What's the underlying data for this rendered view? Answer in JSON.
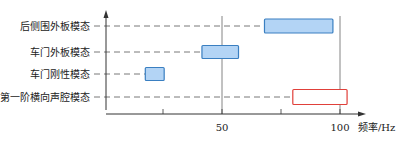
{
  "chart_data": {
    "type": "bar",
    "subtype": "floating-range",
    "title": "",
    "xlabel": "频率/Hz",
    "ylabel": "",
    "xlim": [
      0,
      105
    ],
    "grid": false,
    "legend": "none",
    "x_ticks": [
      25,
      50,
      75,
      100
    ],
    "x_tick_labels": [
      {
        "value": 50,
        "label": "50"
      },
      {
        "value": 100,
        "label": "100"
      }
    ],
    "reference_lines": [
      50,
      100
    ],
    "categories": [
      "后侧围外板模态",
      "车门外板模态",
      "车门刚性模态",
      "第一阶横向声腔模态"
    ],
    "series": [
      {
        "name": "后侧围外板模态",
        "start": 68,
        "end": 97,
        "style": "filled",
        "color": "#b3d4f5",
        "stroke": "#3a7fc1"
      },
      {
        "name": "车门外板模态",
        "start": 41.5,
        "end": 57,
        "style": "filled",
        "color": "#b3d4f5",
        "stroke": "#3a7fc1"
      },
      {
        "name": "车门刚性模态",
        "start": 17.5,
        "end": 25.5,
        "style": "filled",
        "color": "#b3d4f5",
        "stroke": "#3a7fc1"
      },
      {
        "name": "第一阶横向声腔模态",
        "start": 80,
        "end": 103,
        "style": "outline",
        "color": "#ffffff",
        "stroke": "#e0403a"
      }
    ]
  }
}
